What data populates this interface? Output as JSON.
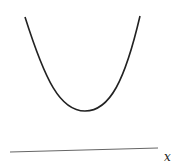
{
  "diagram": {
    "curve": {
      "type": "parabola",
      "start": [
        25,
        17
      ],
      "vertex": [
        85,
        111
      ],
      "end": [
        140,
        16
      ],
      "color": "#222222"
    },
    "axis": {
      "start": [
        10,
        152
      ],
      "end": [
        158,
        148
      ],
      "color": "#555555",
      "label": "x"
    }
  }
}
